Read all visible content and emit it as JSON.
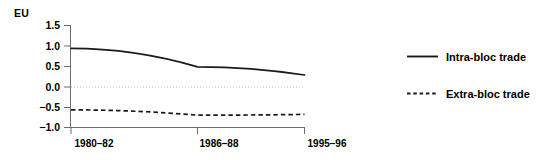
{
  "chart_data": {
    "type": "line",
    "title": "EU",
    "xlabel": "",
    "ylabel": "",
    "categories": [
      "1980–82",
      "1986–88",
      "1995–96"
    ],
    "ylim": [
      -1.0,
      1.5
    ],
    "yticks": [
      "1.5",
      "1.0",
      "0.5",
      "0.0",
      "−0.5",
      "−1.0"
    ],
    "ytick_values": [
      1.5,
      1.0,
      0.5,
      0.0,
      -0.5,
      -1.0
    ],
    "grid": false,
    "zero_reference_line": 0.0,
    "legend_position": "right",
    "series": [
      {
        "name": "Intra-bloc trade",
        "style": "solid",
        "color": "#1a1a1a",
        "values": [
          0.93,
          0.48,
          0.28
        ]
      },
      {
        "name": "Extra-bloc trade",
        "style": "dashed",
        "color": "#1a1a1a",
        "values": [
          -0.57,
          -0.7,
          -0.68
        ]
      }
    ]
  },
  "legend": {
    "items": [
      {
        "label": "Intra-bloc trade",
        "style": "solid"
      },
      {
        "label": "Extra-bloc trade",
        "style": "dashed"
      }
    ]
  },
  "axis": {
    "ytick_0": "1.5",
    "ytick_1": "1.0",
    "ytick_2": "0.5",
    "ytick_3": "0.0",
    "ytick_4": "−0.5",
    "ytick_5": "−1.0",
    "xtick_0": "1980–82",
    "xtick_1": "1986–88",
    "xtick_2": "1995–96"
  },
  "colors": {
    "line": "#1a1a1a",
    "axis": "#6b6b6b",
    "zero_line": "#b5b5b5",
    "text": "#000000",
    "background": "#ffffff"
  }
}
